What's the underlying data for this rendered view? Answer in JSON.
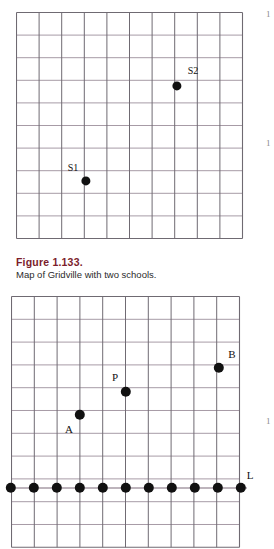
{
  "page": {
    "background_color": "#ffffff",
    "width": 274,
    "height": 537
  },
  "style": {
    "grid_line_vertical_color": "#6f6a72",
    "grid_line_horizontal_color": "#a79ba6",
    "grid_border_color": "#6f6a72",
    "point_color": "#111111",
    "caption_title_color": "#7b1d2b",
    "caption_text_color": "#2b2b2b"
  },
  "figure1": {
    "name": "gridville-map",
    "grid": {
      "columns": 10,
      "rows": 10,
      "cell_size": 22.6,
      "origin_x": 16,
      "origin_y": 12
    },
    "points": [
      {
        "label": "S1",
        "dot_x": 86,
        "dot_y": 181,
        "label_x": 73,
        "label_y": 168,
        "radius": 4.6
      },
      {
        "label": "S2",
        "dot_x": 177,
        "dot_y": 86,
        "label_x": 193,
        "label_y": 71,
        "radius": 4.6
      }
    ],
    "caption_title": "Figure 1.133.",
    "caption_text": "Map of Gridville with two schools."
  },
  "figure2": {
    "name": "grid-with-line-L",
    "grid": {
      "columns": 10,
      "rows": 11,
      "cell_size": 22.8,
      "origin_x": 11,
      "origin_y": 296
    },
    "points": [
      {
        "label": "A",
        "dot_x": 80,
        "dot_y": 415,
        "label_x": 69,
        "label_y": 429,
        "radius": 5.2
      },
      {
        "label": "P",
        "dot_x": 126,
        "dot_y": 392,
        "label_x": 115,
        "label_y": 377,
        "radius": 5.2
      },
      {
        "label": "B",
        "dot_x": 219,
        "dot_y": 368,
        "label_x": 232,
        "label_y": 354,
        "radius": 5.2
      }
    ],
    "line": {
      "label": "L",
      "label_x": 250,
      "label_y": 475,
      "y": 488,
      "x_start": 11,
      "x_end": 241,
      "dot_radius": 5.2,
      "dot_xs": [
        11,
        34,
        57,
        80,
        103,
        126,
        149,
        172,
        195,
        218,
        241
      ]
    }
  },
  "margin_marks": [
    {
      "text": "1",
      "x": 266,
      "y": 10
    },
    {
      "text": "1",
      "x": 266,
      "y": 139
    },
    {
      "text": "1",
      "x": 266,
      "y": 417
    }
  ]
}
